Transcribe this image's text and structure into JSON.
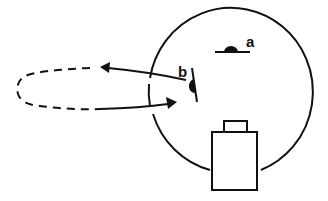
{
  "diagram": {
    "labels": {
      "a": "a",
      "b": "b"
    },
    "colors": {
      "stroke": "#111111",
      "background": "#ffffff"
    },
    "elements": {
      "circle": "large enclosing circle with gaps on left side for arrows and at bottom for box",
      "symbol_a": "half-disk on horizontal line (label a)",
      "symbol_b": "half-disk on tilted line (label b)",
      "outgoing_arrow": "arrow from b leaving circle toward left",
      "return_arrow": "arrow returning into circle toward b",
      "dashed_loop": "dashed loop path outside circle connecting arrows",
      "box": "rectangular box with small tab on top, at bottom of circle"
    }
  }
}
